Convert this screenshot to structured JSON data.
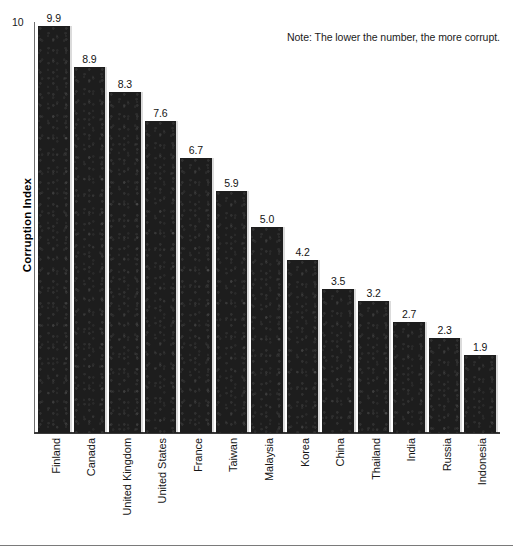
{
  "note": {
    "text": "Note: The lower the number, the more corrupt."
  },
  "axes": {
    "ylabel": "Corruption Index",
    "ytick_top": "10"
  },
  "chart_data": {
    "type": "bar",
    "title": "",
    "xlabel": "",
    "ylabel": "Corruption Index",
    "ylim": [
      0,
      10
    ],
    "yticks": [
      10
    ],
    "grid": false,
    "legend": null,
    "orientation": "vertical",
    "bar_color": "#1d1d1d",
    "value_label_format": "one-decimal",
    "annotations": [
      "Note: The lower the number, the more corrupt."
    ],
    "categories": [
      "Finland",
      "Canada",
      "United Kingdom",
      "United States",
      "France",
      "Taiwan",
      "Malaysia",
      "Korea",
      "China",
      "Thailand",
      "India",
      "Russia",
      "Indonesia"
    ],
    "values": [
      9.9,
      8.9,
      8.3,
      7.6,
      6.7,
      5.9,
      5.0,
      4.2,
      3.5,
      3.2,
      2.7,
      2.3,
      1.9
    ],
    "value_labels": [
      "9.9",
      "8.9",
      "8.3",
      "7.6",
      "6.7",
      "5.9",
      "5.0",
      "4.2",
      "3.5",
      "3.2",
      "2.7",
      "2.3",
      "1.9"
    ]
  }
}
